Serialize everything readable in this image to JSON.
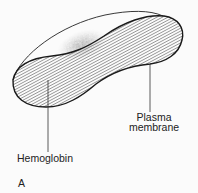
{
  "diagram": {
    "labels": {
      "plasma_line1": "Plasma",
      "plasma_line2": "membrane",
      "hemoglobin": "Hemoglobin",
      "panel": "A"
    },
    "colors": {
      "stroke": "#222222",
      "background": "#fbfbfb",
      "stipple": "#555555"
    }
  }
}
